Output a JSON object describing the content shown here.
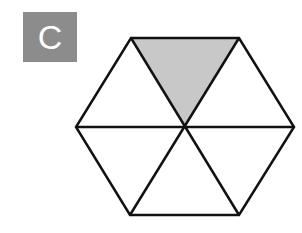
{
  "label": {
    "text": "C",
    "box_color": "#8c8c8c",
    "text_color": "#ffffff"
  },
  "figure": {
    "shape": "regular hexagon divided into 6 triangles",
    "center": [
      185,
      127
    ],
    "vertices": [
      [
        131,
        38
      ],
      [
        239,
        38
      ],
      [
        294,
        127
      ],
      [
        239,
        215
      ],
      [
        130,
        215
      ],
      [
        76,
        127
      ]
    ],
    "shaded_triangle_index": 0,
    "shaded_fraction": "1/6",
    "fill_color": "#c8c8c8",
    "stroke_color": "#111111"
  }
}
